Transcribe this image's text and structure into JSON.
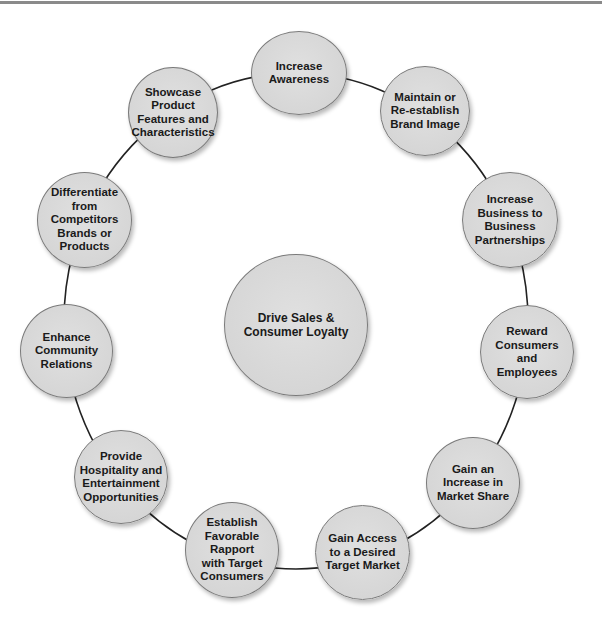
{
  "diagram": {
    "type": "hub-and-ring",
    "center": {
      "label": "Drive Sales &\nConsumer Loyalty"
    },
    "ring_nodes": [
      {
        "label": "Increase\nAwareness"
      },
      {
        "label": "Maintain or\nRe-establish\nBrand Image"
      },
      {
        "label": "Increase\nBusiness to\nBusiness\nPartnerships"
      },
      {
        "label": "Reward\nConsumers and\nEmployees"
      },
      {
        "label": "Gain an\nIncrease in\nMarket Share"
      },
      {
        "label": "Gain Access\nto a Desired\nTarget Market"
      },
      {
        "label": "Establish\nFavorable\nRapport\nwith Target\nConsumers"
      },
      {
        "label": "Provide\nHospitality and\nEntertainment\nOpportunities"
      },
      {
        "label": "Enhance\nCommunity\nRelations"
      },
      {
        "label": "Differentiate\nfrom\nCompetitors\nBrands or\nProducts"
      },
      {
        "label": "Showcase\nProduct\nFeatures and\nCharacteristics"
      }
    ],
    "colors": {
      "node_fill": "#d9d9d9",
      "node_stroke": "#7a7a7a",
      "connector": "#222222",
      "text": "#1a1a1a",
      "top_rule": "#8a8a8a"
    }
  }
}
